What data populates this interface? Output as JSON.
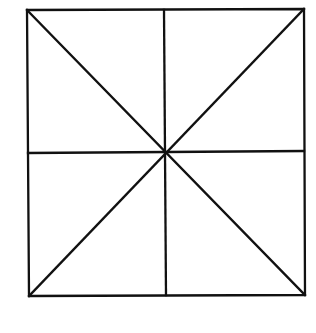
{
  "diagram": {
    "type": "square-divided-into-eight-triangles",
    "stroke_color": "#111111",
    "background_color": "#ffffff",
    "vertices": {
      "top_left": [
        27,
        10
      ],
      "top_right": [
        304,
        9
      ],
      "bottom_right": [
        305,
        295
      ],
      "bottom_left": [
        29,
        296
      ],
      "center": [
        165,
        153
      ],
      "top_mid": [
        164,
        10
      ],
      "bottom_mid": [
        166,
        295
      ],
      "left_mid": [
        28,
        153
      ],
      "right_mid": [
        304,
        151
      ]
    },
    "segments": [
      {
        "name": "outer-square",
        "kind": "polygon"
      },
      {
        "name": "diagonal-tl-br",
        "from": "top_left",
        "to": "bottom_right"
      },
      {
        "name": "diagonal-tr-bl",
        "from": "top_right",
        "to": "bottom_left"
      },
      {
        "name": "vertical-midline",
        "from": "top_mid",
        "to": "bottom_mid"
      },
      {
        "name": "horizontal-midline",
        "from": "left_mid",
        "to": "right_mid"
      }
    ],
    "region_count": 8
  }
}
